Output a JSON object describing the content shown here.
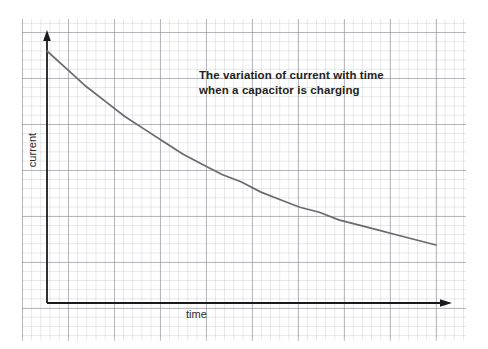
{
  "figure": {
    "title_line1": "The variation of current with time",
    "title_line2": "when a capacitor is charging",
    "background": "graph-paper",
    "paper_color": "#ffffff",
    "major_grid_color": "#8c8c96",
    "minor_grid_color": "#aaafb9",
    "axis_color": "#1a1a1a",
    "curve_color": "#6a6a6a"
  },
  "chart_data": {
    "type": "line",
    "title": "The variation of current with time when a capacitor is charging",
    "xlabel": "time",
    "ylabel": "current",
    "grid": true,
    "legend": null,
    "axis_style": "arrows",
    "tick_labels": {
      "x": [],
      "y": []
    },
    "xlim": [
      0,
      1
    ],
    "ylim": [
      0,
      1
    ],
    "series": [
      {
        "name": "charging current",
        "description": "exponential decay I = I0 * exp(-t/RC)",
        "x": [
          0.0,
          0.05,
          0.1,
          0.15,
          0.2,
          0.25,
          0.3,
          0.35,
          0.4,
          0.45,
          0.5,
          0.55,
          0.6,
          0.65,
          0.7,
          0.75,
          0.8,
          0.85,
          0.9,
          0.95,
          1.0
        ],
        "y": [
          1.0,
          0.93,
          0.86,
          0.8,
          0.74,
          0.69,
          0.64,
          0.59,
          0.55,
          0.51,
          0.48,
          0.44,
          0.41,
          0.38,
          0.36,
          0.33,
          0.31,
          0.29,
          0.27,
          0.25,
          0.23
        ]
      }
    ]
  },
  "labels": {
    "x_axis": "time",
    "y_axis": "current"
  }
}
